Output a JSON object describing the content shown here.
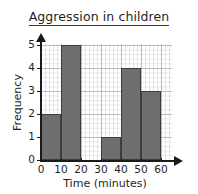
{
  "chart_data": {
    "type": "bar",
    "title": "Aggression in children",
    "xlabel": "Time (minutes)",
    "ylabel": "Frequency",
    "categories": [
      "0-10",
      "10-20",
      "20-30",
      "30-40",
      "40-50",
      "50-60"
    ],
    "bin_edges": [
      0,
      10,
      20,
      30,
      40,
      50,
      60
    ],
    "values": [
      2,
      5,
      0,
      1,
      4,
      3
    ],
    "xlim": [
      0,
      60
    ],
    "ylim": [
      0,
      5
    ],
    "xticks": [
      "0",
      "10",
      "20",
      "30",
      "40",
      "50",
      "60"
    ],
    "yticks": [
      "0",
      "1",
      "2",
      "3",
      "4",
      "5"
    ],
    "grid": true,
    "legend": null,
    "bar_color": "#6e6e6e",
    "bar_edge_color": "#3d3d3d",
    "axis_color": "#1a1a1a",
    "grid_color": "#96969f"
  }
}
